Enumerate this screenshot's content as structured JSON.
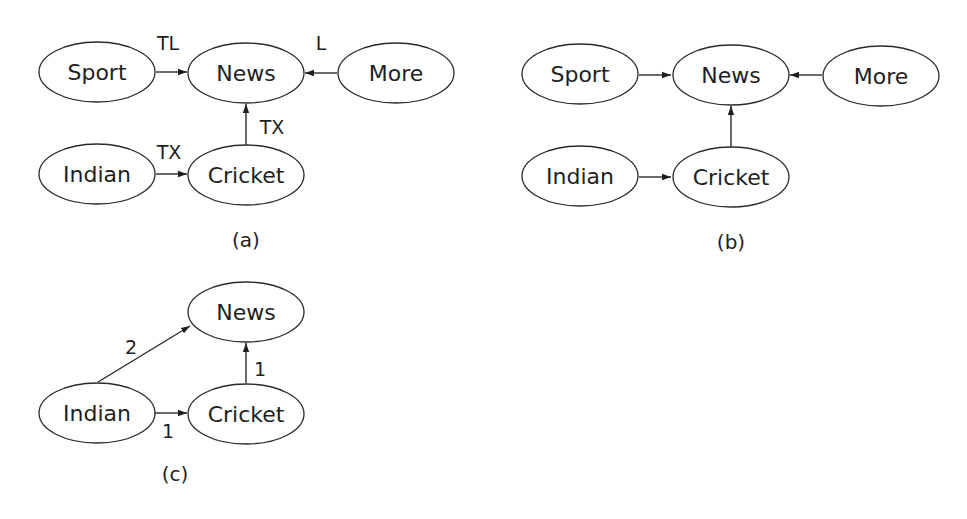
{
  "panels": {
    "a": {
      "caption": "(a)",
      "nodes": {
        "sport": "Sport",
        "news": "News",
        "more": "More",
        "indian": "Indian",
        "cricket": "Cricket"
      },
      "edges": [
        {
          "from": "Sport",
          "to": "News",
          "label": "TL"
        },
        {
          "from": "More",
          "to": "News",
          "label": "L"
        },
        {
          "from": "Cricket",
          "to": "News",
          "label": "TX"
        },
        {
          "from": "Indian",
          "to": "Cricket",
          "label": "TX"
        }
      ],
      "edge_labels": {
        "sport_news": "TL",
        "more_news": "L",
        "cricket_news": "TX",
        "indian_cricket": "TX"
      }
    },
    "b": {
      "caption": "(b)",
      "nodes": {
        "sport": "Sport",
        "news": "News",
        "more": "More",
        "indian": "Indian",
        "cricket": "Cricket"
      },
      "edges": [
        {
          "from": "Sport",
          "to": "News"
        },
        {
          "from": "More",
          "to": "News"
        },
        {
          "from": "Cricket",
          "to": "News"
        },
        {
          "from": "Indian",
          "to": "Cricket"
        }
      ]
    },
    "c": {
      "caption": "(c)",
      "nodes": {
        "news": "News",
        "indian": "Indian",
        "cricket": "Cricket"
      },
      "edges": [
        {
          "from": "Indian",
          "to": "News",
          "label": "2"
        },
        {
          "from": "Cricket",
          "to": "News",
          "label": "1"
        },
        {
          "from": "Indian",
          "to": "Cricket",
          "label": "1"
        }
      ],
      "edge_labels": {
        "indian_news": "2",
        "cricket_news": "1",
        "indian_cricket": "1"
      }
    }
  }
}
